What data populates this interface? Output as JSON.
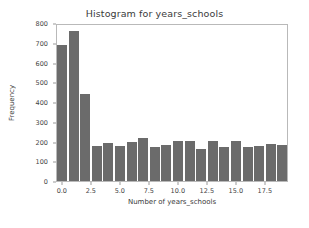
{
  "figure": {
    "background_color": "#ffffff",
    "bar_color": "#6b6b6b",
    "axes_color": "#b9b9b9"
  },
  "chart_data": {
    "type": "bar",
    "title": "Histogram for years_schools",
    "xlabel": "Number of years_schools",
    "ylabel": "Frequency",
    "xlim": [
      -0.5,
      19.5
    ],
    "ylim": [
      0,
      800
    ],
    "grid": false,
    "legend": null,
    "xticks": [
      0.0,
      2.5,
      5.0,
      7.5,
      10.0,
      12.5,
      15.0,
      17.5
    ],
    "xticklabels": [
      "0.0",
      "2.5",
      "5.0",
      "7.5",
      "10.0",
      "12.5",
      "15.0",
      "17.5"
    ],
    "yticks": [
      0,
      100,
      200,
      300,
      400,
      500,
      600,
      700,
      800
    ],
    "yticklabels": [
      "0",
      "100",
      "200",
      "300",
      "400",
      "500",
      "600",
      "700",
      "800"
    ],
    "bin_centers": [
      0,
      1,
      2,
      3,
      4,
      5,
      6,
      7,
      8,
      9,
      10,
      11,
      12,
      13,
      14,
      15,
      16,
      17,
      18,
      19
    ],
    "bin_width": 1,
    "values": [
      690,
      760,
      440,
      178,
      190,
      175,
      197,
      218,
      172,
      180,
      205,
      202,
      160,
      203,
      173,
      203,
      170,
      176,
      188,
      180
    ]
  }
}
